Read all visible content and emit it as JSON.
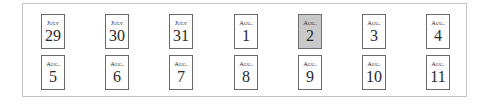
{
  "calendar": {
    "selected_index": 4,
    "colors": {
      "selected_fill": "#c9c9c9",
      "border": "#6a6a6a",
      "frame": "#c4c4c4"
    },
    "rows": [
      [
        {
          "month": "July",
          "day": "29"
        },
        {
          "month": "July",
          "day": "30"
        },
        {
          "month": "July",
          "day": "31"
        },
        {
          "month": "Aug.",
          "day": "1"
        },
        {
          "month": "Aug.",
          "day": "2"
        },
        {
          "month": "Aug.",
          "day": "3"
        },
        {
          "month": "Aug.",
          "day": "4"
        }
      ],
      [
        {
          "month": "Aug.",
          "day": "5"
        },
        {
          "month": "Aug.",
          "day": "6"
        },
        {
          "month": "Aug.",
          "day": "7"
        },
        {
          "month": "Aug.",
          "day": "8"
        },
        {
          "month": "Aug.",
          "day": "9"
        },
        {
          "month": "Aug.",
          "day": "10"
        },
        {
          "month": "Aug.",
          "day": "11"
        }
      ]
    ]
  }
}
